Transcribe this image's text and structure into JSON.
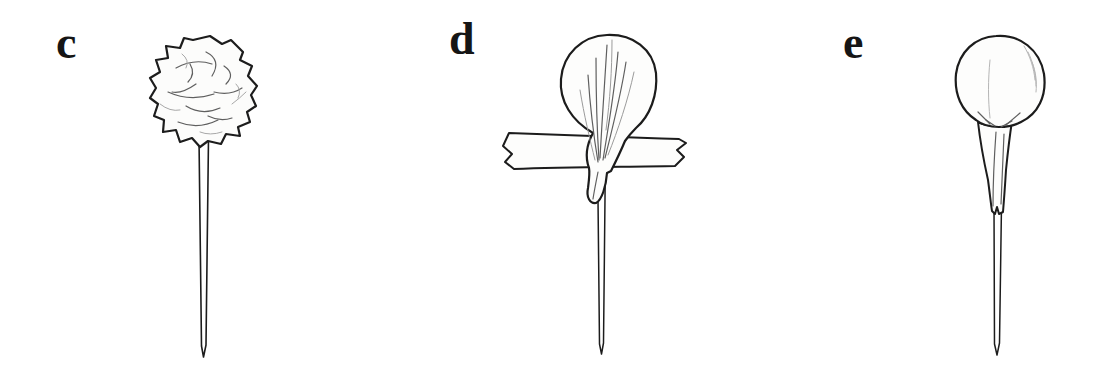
{
  "page": {
    "background_color": "#ffffff",
    "ink_color": "#1c1c1c",
    "shade_color": "#666666",
    "light_shade_color": "#a8a8a8"
  },
  "figures": [
    {
      "label": "c",
      "drawing": "crumpled-paper-ball-on-pin"
    },
    {
      "label": "d",
      "drawing": "paper-draped-ball-on-pin-with-tape-strip"
    },
    {
      "label": "e",
      "drawing": "paper-wrapped-ball-gathered-around-pin"
    }
  ]
}
